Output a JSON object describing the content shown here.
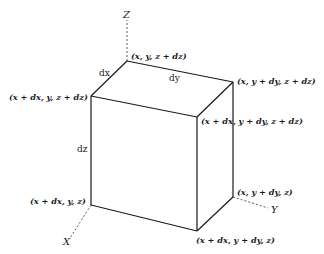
{
  "diagram": {
    "type": "differential-volume-element",
    "axes": {
      "z": "Z",
      "x": "X",
      "y": "Y"
    },
    "dimensions": {
      "dx": "dx",
      "dy": "dy",
      "dz": "dz"
    },
    "vertices": {
      "top_back": "(x, y, z + dz)",
      "top_front_left": "(x + dx, y, z + dz)",
      "top_back_right": "(x, y + dy, z + dz)",
      "top_front_right": "(x + dx, y + dy, z + dz)",
      "bottom_front_left": "(x + dx, y, z)",
      "bottom_back_right": "(x, y + dy, z)",
      "bottom_front_right": "(x + dx, y + dy, z)"
    },
    "colors": {
      "line": "#1a1a1a",
      "background": "#ffffff"
    }
  }
}
